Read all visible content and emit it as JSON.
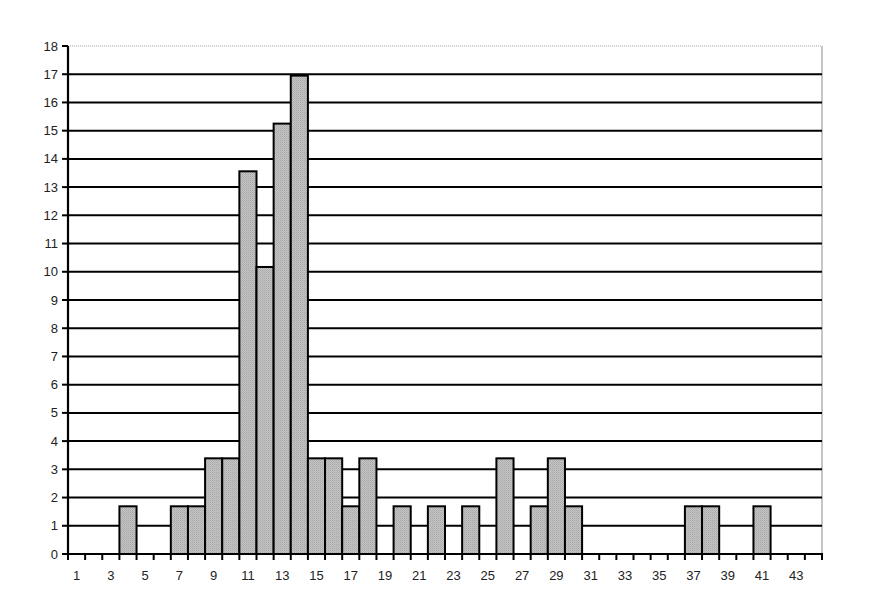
{
  "chart_data": {
    "type": "bar",
    "title": "",
    "xlabel": "",
    "ylabel": "",
    "categories": [
      1,
      2,
      3,
      4,
      5,
      6,
      7,
      8,
      9,
      10,
      11,
      12,
      13,
      14,
      15,
      16,
      17,
      18,
      19,
      20,
      21,
      22,
      23,
      24,
      25,
      26,
      27,
      28,
      29,
      30,
      31,
      32,
      33,
      34,
      35,
      36,
      37,
      38,
      39,
      40,
      41,
      42,
      43,
      44
    ],
    "values": [
      0,
      0,
      0,
      1.69,
      0,
      0,
      1.69,
      1.69,
      3.39,
      3.39,
      13.56,
      10.17,
      15.25,
      16.95,
      3.39,
      3.39,
      1.69,
      3.39,
      0,
      1.69,
      0,
      1.69,
      0,
      1.69,
      0,
      3.39,
      0,
      1.69,
      3.39,
      1.69,
      0,
      0,
      0,
      0,
      0,
      0,
      1.69,
      1.69,
      0,
      0,
      1.69,
      0,
      0,
      0
    ],
    "ylim": [
      0,
      18
    ],
    "yticks": [
      0,
      1,
      2,
      3,
      4,
      5,
      6,
      7,
      8,
      9,
      10,
      11,
      12,
      13,
      14,
      15,
      16,
      17,
      18
    ],
    "xtick_labels": [
      "1",
      "3",
      "5",
      "7",
      "9",
      "11",
      "13",
      "15",
      "17",
      "19",
      "21",
      "23",
      "25",
      "27",
      "29",
      "31",
      "33",
      "35",
      "37",
      "39",
      "41",
      "43"
    ],
    "grid": true,
    "legend": null,
    "colors": {
      "bar_fill": "#bdbdbd",
      "bar_edge": "#000000",
      "gridline": "#000000",
      "frame": "#a0a0a0"
    }
  }
}
